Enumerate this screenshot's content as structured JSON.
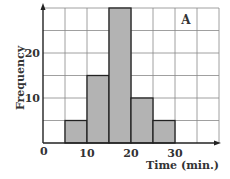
{
  "chart_data": {
    "type": "bar",
    "subtype": "histogram",
    "title": "",
    "panel_label": "A",
    "xlabel": "Time (min.)",
    "ylabel": "Frequency",
    "bins": [
      [
        5,
        10
      ],
      [
        10,
        15
      ],
      [
        15,
        20
      ],
      [
        20,
        25
      ],
      [
        25,
        30
      ]
    ],
    "categories": [
      "5-10",
      "10-15",
      "15-20",
      "20-25",
      "25-30"
    ],
    "values": [
      5,
      15,
      30,
      10,
      5
    ],
    "xlim": [
      0,
      40
    ],
    "ylim": [
      0,
      30
    ],
    "x_ticks": [
      0,
      10,
      20,
      30
    ],
    "y_ticks": [
      10,
      20
    ],
    "grid": true,
    "grid_step_x": 5,
    "grid_step_y": 5,
    "bar_color": "#b3b3b3",
    "edge_color": "#222222"
  },
  "labels": {
    "origin": "0",
    "x10": "10",
    "x20": "20",
    "x30": "30",
    "y10": "10",
    "y20": "20",
    "panel": "A",
    "xlabel": "Time (min.)",
    "ylabel": "Frequency"
  }
}
